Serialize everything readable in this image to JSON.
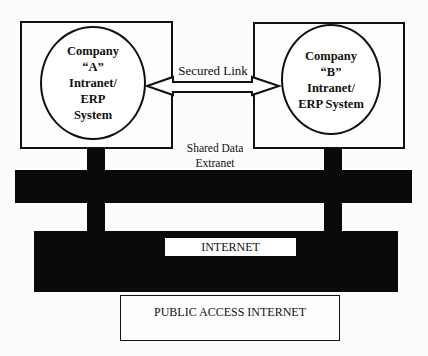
{
  "diagram": {
    "company_a": {
      "lines": [
        "Company",
        "“A”",
        "Intranet/",
        "ERP",
        "System"
      ]
    },
    "company_b": {
      "lines": [
        "Company",
        "“B”",
        "Intranet/",
        "ERP System"
      ]
    },
    "link": {
      "label": "Secured Link",
      "type": "bidirectional-arrow"
    },
    "extranet": {
      "lines": [
        "Shared Data",
        "Extranet"
      ]
    },
    "internet": {
      "label": "INTERNET"
    },
    "public": {
      "label": "PUBLIC ACCESS INTERNET"
    },
    "colors": {
      "band": "#0a0a0a",
      "stroke": "#111111",
      "background": "#fcfcfc"
    }
  }
}
